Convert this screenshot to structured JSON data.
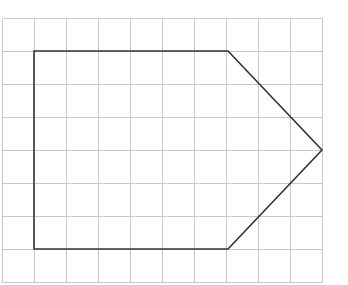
{
  "figure": {
    "title_partial": "g",
    "background_color": "#ffffff",
    "width": 348,
    "height": 285
  },
  "grid": {
    "line_color": "#c9c9c9",
    "line_width": 1,
    "columns": 10,
    "rows": 8,
    "cell_width": 32,
    "cell_height": 33,
    "origin_x": 2,
    "origin_y": 18,
    "x_lines": [
      2,
      34,
      66,
      98,
      130,
      162,
      194,
      226,
      258,
      290,
      322
    ],
    "y_lines": [
      18,
      51,
      84,
      117,
      150,
      183,
      216,
      249,
      282
    ]
  },
  "shape": {
    "name": "arrow-pentagon",
    "stroke_color": "#333333",
    "stroke_width": 1.6,
    "fill": "none",
    "closed": true,
    "vertex_count": 5,
    "points_px": [
      [
        34,
        51
      ],
      [
        228,
        51
      ],
      [
        322,
        150
      ],
      [
        228,
        249
      ],
      [
        34,
        249
      ]
    ],
    "points_attr": "34,51 228,51 322,150 228,249 34,249",
    "vertices_grid": [
      {
        "label": "top-left",
        "col": 1,
        "row": 1
      },
      {
        "label": "top-right",
        "col": 7,
        "row": 1
      },
      {
        "label": "apex-right",
        "col": 10,
        "row": 4
      },
      {
        "label": "bottom-right",
        "col": 7,
        "row": 7
      },
      {
        "label": "bottom-left",
        "col": 1,
        "row": 7
      }
    ]
  },
  "chart_data": {
    "type": "scatter",
    "title": "g",
    "xlabel": "",
    "ylabel": "",
    "grid": true,
    "legend": "none",
    "xlim": [
      0,
      10
    ],
    "ylim": [
      0,
      8
    ],
    "annotations": [
      "Pentagon / arrow shape drawn on square grid paper",
      "Rectangular body 6 units wide by 6 units tall",
      "Triangular point extends 3 units to the right"
    ],
    "series": [
      {
        "name": "arrow-pentagon-outline",
        "x": [
          1,
          7,
          10,
          7,
          1,
          1
        ],
        "y": [
          7,
          7,
          4,
          1,
          1,
          7
        ]
      }
    ]
  }
}
